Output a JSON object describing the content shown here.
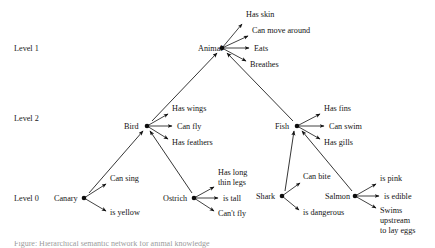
{
  "diagram": {
    "type": "semantic-network-hierarchy",
    "width": 435,
    "height": 248,
    "background_color": "#ffffff",
    "ink_color": "#121212",
    "levels": [
      {
        "id": "level-1",
        "label": "Level 1",
        "x": 14,
        "y": 51
      },
      {
        "id": "level-2",
        "label": "Level 2",
        "x": 14,
        "y": 121
      },
      {
        "id": "level-0",
        "label": "Level 0",
        "x": 14,
        "y": 201
      }
    ],
    "concepts": [
      {
        "id": "animal",
        "label": "Animal",
        "label_x": 198,
        "label_y": 51,
        "label_anchor": "start",
        "dot_x": 222,
        "dot_y": 48,
        "level": "level-1",
        "properties": [
          {
            "id": "animal-has-skin",
            "label": "Has skin",
            "tip_x": 242,
            "tip_y": 24,
            "text_x": 246,
            "text_y": 17,
            "lines": [
              "Has skin"
            ]
          },
          {
            "id": "animal-can-move-around",
            "label": "Can move around",
            "tip_x": 248,
            "tip_y": 36,
            "text_x": 252,
            "text_y": 33,
            "lines": [
              "Can move around"
            ]
          },
          {
            "id": "animal-eats",
            "label": "Eats",
            "tip_x": 249,
            "tip_y": 48,
            "text_x": 254,
            "text_y": 51,
            "lines": [
              "Eats"
            ]
          },
          {
            "id": "animal-breathes",
            "label": "Breathes",
            "tip_x": 246,
            "tip_y": 61,
            "text_x": 250,
            "text_y": 67,
            "lines": [
              "Breathes"
            ]
          }
        ]
      },
      {
        "id": "bird",
        "label": "Bird",
        "label_x": 124,
        "label_y": 129,
        "label_anchor": "start",
        "dot_x": 147,
        "dot_y": 126,
        "level": "level-2",
        "properties": [
          {
            "id": "bird-has-wings",
            "label": "Has wings",
            "tip_x": 168,
            "tip_y": 114,
            "text_x": 172,
            "text_y": 111,
            "lines": [
              "Has wings"
            ]
          },
          {
            "id": "bird-can-fly",
            "label": "Can fly",
            "tip_x": 172,
            "tip_y": 126,
            "text_x": 177,
            "text_y": 129,
            "lines": [
              "Can fly"
            ]
          },
          {
            "id": "bird-has-feathers",
            "label": "Has feathers",
            "tip_x": 168,
            "tip_y": 139,
            "text_x": 172,
            "text_y": 145,
            "lines": [
              "Has feathers"
            ]
          }
        ]
      },
      {
        "id": "fish",
        "label": "Fish",
        "label_x": 275,
        "label_y": 129,
        "label_anchor": "start",
        "dot_x": 297,
        "dot_y": 126,
        "level": "level-2",
        "properties": [
          {
            "id": "fish-has-fins",
            "label": "Has fins",
            "tip_x": 320,
            "tip_y": 114,
            "text_x": 324,
            "text_y": 111,
            "lines": [
              "Has fins"
            ]
          },
          {
            "id": "fish-can-swim",
            "label": "Can swim",
            "tip_x": 324,
            "tip_y": 126,
            "text_x": 329,
            "text_y": 129,
            "lines": [
              "Can swim"
            ]
          },
          {
            "id": "fish-has-gills",
            "label": "Has gills",
            "tip_x": 320,
            "tip_y": 139,
            "text_x": 324,
            "text_y": 145,
            "lines": [
              "Has gills"
            ]
          }
        ]
      },
      {
        "id": "canary",
        "label": "Canary",
        "label_x": 54,
        "label_y": 201,
        "label_anchor": "start",
        "dot_x": 84,
        "dot_y": 198,
        "level": "level-0",
        "properties": [
          {
            "id": "canary-can-sing",
            "label": "Can sing",
            "tip_x": 106,
            "tip_y": 184,
            "text_x": 110,
            "text_y": 181,
            "lines": [
              "Can sing"
            ]
          },
          {
            "id": "canary-is-yellow",
            "label": "is yellow",
            "tip_x": 106,
            "tip_y": 211,
            "text_x": 110,
            "text_y": 215,
            "lines": [
              "is yellow"
            ]
          }
        ]
      },
      {
        "id": "ostrich",
        "label": "Ostrich",
        "label_x": 163,
        "label_y": 201,
        "label_anchor": "start",
        "dot_x": 194,
        "dot_y": 198,
        "level": "level-0",
        "properties": [
          {
            "id": "ostrich-has-long-thin-legs",
            "label": "Has long thin legs",
            "tip_x": 214,
            "tip_y": 187,
            "text_x": 218,
            "text_y": 175,
            "lines": [
              "Has long",
              "thin legs"
            ]
          },
          {
            "id": "ostrich-is-tall",
            "label": "is tall",
            "tip_x": 218,
            "tip_y": 198,
            "text_x": 223,
            "text_y": 201,
            "lines": [
              "is tall"
            ]
          },
          {
            "id": "ostrich-cant-fly",
            "label": "Can't fly",
            "tip_x": 214,
            "tip_y": 211,
            "text_x": 218,
            "text_y": 216,
            "lines": [
              "Can't fly"
            ]
          }
        ]
      },
      {
        "id": "shark",
        "label": "Shark",
        "label_x": 256,
        "label_y": 199,
        "label_anchor": "start",
        "dot_x": 282,
        "dot_y": 196,
        "level": "level-0",
        "properties": [
          {
            "id": "shark-can-bite",
            "label": "Can bite",
            "tip_x": 300,
            "tip_y": 183,
            "text_x": 303,
            "text_y": 179,
            "lines": [
              "Can bite"
            ]
          },
          {
            "id": "shark-is-dangerous",
            "label": "is dangerous",
            "tip_x": 299,
            "tip_y": 210,
            "text_x": 303,
            "text_y": 215,
            "lines": [
              "is dangerous"
            ]
          }
        ]
      },
      {
        "id": "salmon",
        "label": "Salmon",
        "label_x": 325,
        "label_y": 199,
        "label_anchor": "start",
        "dot_x": 355,
        "dot_y": 196,
        "level": "level-0",
        "properties": [
          {
            "id": "salmon-is-pink",
            "label": "is pink",
            "tip_x": 376,
            "tip_y": 184,
            "text_x": 380,
            "text_y": 181,
            "lines": [
              "is pink"
            ]
          },
          {
            "id": "salmon-is-edible",
            "label": "is edible",
            "tip_x": 379,
            "tip_y": 196,
            "text_x": 384,
            "text_y": 199,
            "lines": [
              "is edible"
            ]
          },
          {
            "id": "salmon-swims-upstream-to-lay-eggs",
            "label": "Swims upstream to lay eggs",
            "tip_x": 376,
            "tip_y": 208,
            "text_x": 380,
            "text_y": 213,
            "lines": [
              "Swims",
              "upstream",
              "to lay eggs"
            ]
          }
        ]
      }
    ],
    "hierarchy_edges": [
      {
        "id": "edge-bird-animal",
        "from": "bird",
        "to": "animal",
        "x1": 152,
        "y1": 121,
        "x2": 217,
        "y2": 53,
        "arrow_at": "to"
      },
      {
        "id": "edge-fish-animal",
        "from": "fish",
        "to": "animal",
        "x1": 293,
        "y1": 121,
        "x2": 227,
        "y2": 53,
        "arrow_at": "to"
      },
      {
        "id": "edge-canary-bird",
        "from": "canary",
        "to": "bird",
        "x1": 89,
        "y1": 193,
        "x2": 143,
        "y2": 131,
        "arrow_at": "to"
      },
      {
        "id": "edge-ostrich-bird",
        "from": "ostrich",
        "to": "bird",
        "x1": 192,
        "y1": 193,
        "x2": 150,
        "y2": 131,
        "arrow_at": "to"
      },
      {
        "id": "edge-shark-fish",
        "from": "shark",
        "to": "fish",
        "x1": 285,
        "y1": 191,
        "x2": 294,
        "y2": 131,
        "arrow_at": "to"
      },
      {
        "id": "edge-salmon-fish",
        "from": "salmon",
        "to": "fish",
        "x1": 352,
        "y1": 191,
        "x2": 302,
        "y2": 131,
        "arrow_at": "to"
      }
    ],
    "caption": {
      "text": "Figure: Hierarchical semantic network for animal knowledge",
      "visible": "partially-cropped"
    }
  }
}
